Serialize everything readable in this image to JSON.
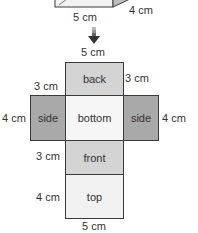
{
  "prism": {
    "bottom_edge_label": "5 cm",
    "depth_label": "4 cm"
  },
  "arrow": {
    "icon": "down-arrow-icon"
  },
  "net": {
    "top_width_label": "5 cm",
    "bottom_width_label": "5 cm",
    "faces": {
      "back": "back",
      "side_left": "side",
      "bottom": "bottom",
      "side_right": "side",
      "front": "front",
      "top": "top"
    },
    "dimensions": {
      "back_left": "3 cm",
      "back_right": "3 cm",
      "side_left": "4 cm",
      "side_right": "4 cm",
      "front_left": "3 cm",
      "top_left": "4 cm"
    }
  },
  "colors": {
    "back": "#d4d4d4",
    "side": "#a9a9a9",
    "bottom": "#f6f6f6",
    "front": "#d4d4d4",
    "top": "#f2f2f2",
    "outline": "#3a3a3a"
  }
}
